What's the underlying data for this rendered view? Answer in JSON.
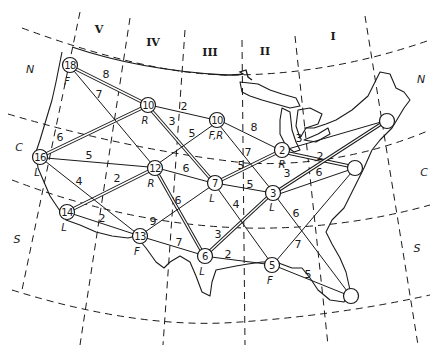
{
  "diagram": {
    "type": "transportation network on map of the contiguous United States",
    "zones": [
      {
        "id": "V",
        "label": "V"
      },
      {
        "id": "IV",
        "label": "IV"
      },
      {
        "id": "III",
        "label": "III"
      },
      {
        "id": "II",
        "label": "II"
      },
      {
        "id": "I",
        "label": "I"
      }
    ],
    "bands": {
      "left": [
        {
          "label": "N"
        },
        {
          "label": "C"
        },
        {
          "label": "S"
        }
      ],
      "right": [
        {
          "label": "N"
        },
        {
          "label": "C"
        },
        {
          "label": "S"
        }
      ]
    },
    "nodes": [
      {
        "id": "n18",
        "value": "18",
        "tag": "F"
      },
      {
        "id": "n10r",
        "value": "10",
        "tag": "R"
      },
      {
        "id": "n10fr",
        "value": "10",
        "tag": "F,R"
      },
      {
        "id": "n16",
        "value": "16",
        "tag": "L"
      },
      {
        "id": "n12",
        "value": "12",
        "tag": "R"
      },
      {
        "id": "n7",
        "value": "7",
        "tag": "L"
      },
      {
        "id": "n2",
        "value": "2",
        "tag": "R"
      },
      {
        "id": "n3",
        "value": "3",
        "tag": "L"
      },
      {
        "id": "n14",
        "value": "14",
        "tag": "L"
      },
      {
        "id": "n13",
        "value": "13",
        "tag": "F"
      },
      {
        "id": "n6",
        "value": "6",
        "tag": "L"
      },
      {
        "id": "n5",
        "value": "5",
        "tag": "F"
      },
      {
        "id": "ne1",
        "value": "",
        "tag": ""
      },
      {
        "id": "ne2",
        "value": "",
        "tag": ""
      },
      {
        "id": "se1",
        "value": "",
        "tag": ""
      }
    ],
    "edges": [
      {
        "from": "n18",
        "to": "n10r",
        "weight": "8",
        "double": true
      },
      {
        "from": "n18",
        "to": "n12",
        "weight": "7",
        "double": false
      },
      {
        "from": "n16",
        "to": "n10r",
        "weight": "6",
        "double": true
      },
      {
        "from": "n16",
        "to": "n12",
        "weight": "5",
        "double": false
      },
      {
        "from": "n16",
        "to": "n13",
        "weight": "4",
        "double": false
      },
      {
        "from": "n14",
        "to": "n12",
        "weight": "2",
        "double": true
      },
      {
        "from": "n14",
        "to": "n13",
        "weight": "2",
        "double": false
      },
      {
        "from": "n10r",
        "to": "n10fr",
        "weight": "2",
        "double": false
      },
      {
        "from": "n10r",
        "to": "n7",
        "weight": "3",
        "double": true
      },
      {
        "from": "n10fr",
        "to": "n12",
        "weight": "5",
        "double": false
      },
      {
        "from": "n10fr",
        "to": "n2",
        "weight": "8",
        "double": false
      },
      {
        "from": "n10fr",
        "to": "n3",
        "weight": "7",
        "double": false
      },
      {
        "from": "n12",
        "to": "n7",
        "weight": "6",
        "double": false
      },
      {
        "from": "n12",
        "to": "n6",
        "weight": "6",
        "double": true
      },
      {
        "from": "n13",
        "to": "n7",
        "weight": "9",
        "double": false
      },
      {
        "from": "n13",
        "to": "n6",
        "weight": "7",
        "double": false
      },
      {
        "from": "n7",
        "to": "n2",
        "weight": "5",
        "double": true
      },
      {
        "from": "n7",
        "to": "n3",
        "weight": "5",
        "double": false
      },
      {
        "from": "n7",
        "to": "n5",
        "weight": "4",
        "double": false
      },
      {
        "from": "n6",
        "to": "n3",
        "weight": "3",
        "double": true
      },
      {
        "from": "n6",
        "to": "n5",
        "weight": "2",
        "double": false
      },
      {
        "from": "n2",
        "to": "ne1",
        "weight": "3",
        "double": false
      },
      {
        "from": "n2",
        "to": "ne2",
        "weight": "2",
        "double": true
      },
      {
        "from": "n3",
        "to": "ne1",
        "weight": "3",
        "double": true
      },
      {
        "from": "n3",
        "to": "ne2",
        "weight": "6",
        "double": false
      },
      {
        "from": "n3",
        "to": "se1",
        "weight": "6",
        "double": false
      },
      {
        "from": "n5",
        "to": "ne2",
        "weight": "7",
        "double": false
      },
      {
        "from": "n5",
        "to": "se1",
        "weight": "5",
        "double": false
      }
    ]
  }
}
